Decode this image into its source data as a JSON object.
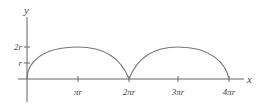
{
  "diagram": {
    "axes": {
      "x_label": "x",
      "y_label": "y"
    },
    "y_ticks": [
      {
        "label": "2r",
        "value": 2
      },
      {
        "label": "r",
        "value": 1
      }
    ],
    "x_ticks": [
      {
        "label": "πr",
        "value": 1
      },
      {
        "label": "2πr",
        "value": 2
      },
      {
        "label": "3πr",
        "value": 3
      },
      {
        "label": "4πr",
        "value": 4
      }
    ],
    "curve": {
      "type": "cycloid-like arches",
      "arches": [
        {
          "start": "0",
          "end": "2πr",
          "peak": "2r"
        },
        {
          "start": "2πr",
          "end": "4πr",
          "peak": "2r"
        }
      ],
      "color": "#666666"
    }
  }
}
